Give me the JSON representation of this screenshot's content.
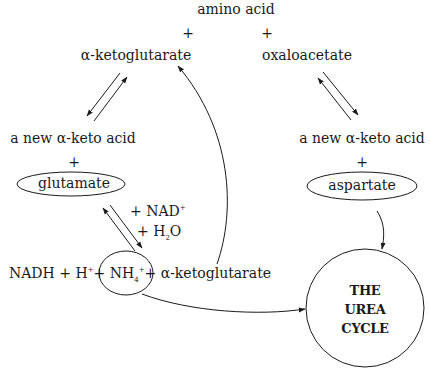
{
  "diagram": {
    "title_node": "amino acid",
    "plus": "+",
    "left_top": "α-ketoglutarate",
    "right_top": "oxaloacetate",
    "left_mid": "a new α-keto acid",
    "right_mid": "a new α-keto acid",
    "left_circled": "glutamate",
    "right_circled": "aspartate",
    "reagent_nad": "+ NAD",
    "reagent_nad_sup": "+",
    "reagent_h2o_pre": "+ H",
    "reagent_h2o_sub": "2",
    "reagent_h2o_post": "O",
    "products_nadh": "NADH + H",
    "products_h_sup": "+",
    "products_nh4_pre": "+ NH",
    "products_nh4_sub": "4",
    "products_nh4_sup": "+",
    "products_akg": "+ α-ketoglutarate",
    "urea_line1": "THE",
    "urea_line2": "UREA",
    "urea_line3": "CYCLE"
  },
  "colors": {
    "ink": "#1a1a1a",
    "background": "#ffffff"
  }
}
